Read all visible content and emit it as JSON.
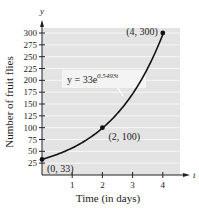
{
  "chart_data": {
    "type": "line",
    "title": "",
    "xlabel": "Time (in days)",
    "ylabel": "Number of fruit flies",
    "x_axis_var": "t",
    "y_axis_var": "y",
    "xlim": [
      0,
      4.5
    ],
    "ylim": [
      0,
      310
    ],
    "x_ticks": [
      1,
      2,
      3,
      4
    ],
    "y_ticks": [
      25,
      50,
      75,
      100,
      125,
      150,
      175,
      200,
      225,
      250,
      275,
      300
    ],
    "grid": "horizontal",
    "series": [
      {
        "name": "y = 33e^(0.5493t)",
        "function": "33*exp(0.5493*t)",
        "x": [
          0,
          0.5,
          1,
          1.5,
          2,
          2.5,
          3,
          3.5,
          4
        ],
        "values": [
          33,
          43.4,
          57.2,
          75.3,
          99.1,
          130.4,
          171.7,
          226.0,
          297.5
        ]
      }
    ],
    "points": [
      {
        "x": 0,
        "y": 33,
        "label": "(0, 33)"
      },
      {
        "x": 2,
        "y": 100,
        "label": "(2, 100)"
      },
      {
        "x": 4,
        "y": 300,
        "label": "(4, 300)"
      }
    ],
    "annotations": [
      {
        "text_main": "y = 33e",
        "text_sup": "0.5493t"
      }
    ],
    "colors": {
      "plot_background": "#e3e3e3",
      "gridline": "#f7f7f7",
      "curve": "#111111",
      "axis": "#222222"
    }
  }
}
